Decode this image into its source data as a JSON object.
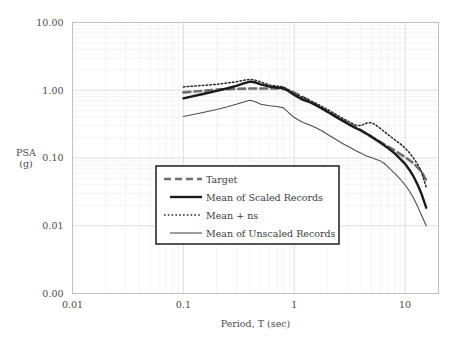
{
  "chart_data": {
    "type": "line",
    "title": "",
    "xlabel": "Period, T (sec)",
    "ylabel": "PSA\n(g)",
    "ylabel_line1": "PSA",
    "ylabel_line2": "(g)",
    "xscale": "log",
    "yscale": "log",
    "xlim": [
      0.01,
      20
    ],
    "ylim": [
      0.004,
      10
    ],
    "xticks": [
      "0.01",
      "0.1",
      "1",
      "10"
    ],
    "xtick_values": [
      0.01,
      0.1,
      1,
      10
    ],
    "yticks": [
      "10.00",
      "1.00",
      "0.10",
      "0.01",
      "0.00"
    ],
    "ytick_values": [
      10,
      1,
      0.1,
      0.01,
      0.004
    ],
    "grid": true,
    "grid_color": "#d9d9d9",
    "minor_grid_color": "#ececec",
    "border_color": "#bfbfbf",
    "legend_position": "center-left-inside",
    "series": [
      {
        "name": "Target",
        "style": "thick-dashed",
        "color": "#6f6f6f",
        "width": 2.6,
        "dash": "7,4",
        "x": [
          0.1,
          0.15,
          0.2,
          0.3,
          0.4,
          0.5,
          0.6,
          0.75,
          0.9,
          1.0,
          1.3,
          1.6,
          2.0,
          2.5,
          3.0,
          4.0,
          5.0,
          6.0,
          7.0,
          8.0,
          10.0,
          12.0,
          14.0,
          15.5
        ],
        "values": [
          0.93,
          0.98,
          1.02,
          1.05,
          1.06,
          1.06,
          1.06,
          1.06,
          1.0,
          0.92,
          0.74,
          0.6,
          0.49,
          0.395,
          0.335,
          0.255,
          0.205,
          0.172,
          0.148,
          0.13,
          0.103,
          0.083,
          0.063,
          0.047
        ]
      },
      {
        "name": "Mean of Scaled Records",
        "style": "thick-solid",
        "color": "#1a1a1a",
        "width": 2.4,
        "dash": "none",
        "x": [
          0.1,
          0.15,
          0.2,
          0.25,
          0.3,
          0.35,
          0.4,
          0.45,
          0.5,
          0.6,
          0.7,
          0.8,
          0.9,
          1.0,
          1.2,
          1.4,
          1.6,
          1.8,
          2.0,
          2.4,
          2.8,
          3.2,
          3.6,
          4.0,
          4.5,
          5.0,
          5.5,
          6.0,
          7.0,
          8.0,
          9.0,
          10.0,
          11.0,
          12.0,
          13.0,
          14.0,
          15.5
        ],
        "values": [
          0.76,
          0.88,
          0.98,
          1.07,
          1.16,
          1.26,
          1.34,
          1.3,
          1.22,
          1.13,
          1.1,
          1.08,
          0.96,
          0.85,
          0.72,
          0.66,
          0.59,
          0.53,
          0.48,
          0.4,
          0.345,
          0.305,
          0.275,
          0.255,
          0.228,
          0.205,
          0.185,
          0.168,
          0.14,
          0.118,
          0.098,
          0.082,
          0.066,
          0.052,
          0.04,
          0.03,
          0.0185
        ]
      },
      {
        "name": "Mean + ns",
        "style": "dotted",
        "color": "#2a2a2a",
        "width": 1.5,
        "dash": "1.6,2.2",
        "x": [
          0.1,
          0.15,
          0.2,
          0.25,
          0.3,
          0.35,
          0.4,
          0.45,
          0.5,
          0.6,
          0.7,
          0.8,
          0.9,
          1.0,
          1.2,
          1.4,
          1.6,
          1.8,
          2.0,
          2.4,
          2.8,
          3.2,
          3.6,
          4.0,
          4.3,
          4.6,
          5.0,
          5.4,
          6.0,
          7.0,
          8.0,
          9.0,
          10.0,
          11.0,
          12.0,
          13.0,
          14.0,
          15.5
        ],
        "values": [
          1.12,
          1.18,
          1.22,
          1.28,
          1.33,
          1.4,
          1.45,
          1.4,
          1.32,
          1.2,
          1.15,
          1.12,
          1.0,
          0.9,
          0.78,
          0.7,
          0.63,
          0.57,
          0.52,
          0.435,
          0.375,
          0.335,
          0.305,
          0.3,
          0.32,
          0.33,
          0.33,
          0.31,
          0.272,
          0.222,
          0.188,
          0.163,
          0.14,
          0.118,
          0.098,
          0.08,
          0.063,
          0.037
        ]
      },
      {
        "name": "Mean of Unscaled Records",
        "style": "thin-solid",
        "color": "#4d4d4d",
        "width": 1.1,
        "dash": "none",
        "x": [
          0.1,
          0.15,
          0.2,
          0.25,
          0.3,
          0.35,
          0.4,
          0.45,
          0.5,
          0.6,
          0.7,
          0.8,
          0.9,
          1.0,
          1.2,
          1.4,
          1.6,
          1.8,
          2.0,
          2.4,
          2.8,
          3.2,
          3.6,
          4.0,
          4.5,
          5.0,
          5.5,
          6.0,
          6.5,
          7.0,
          8.0,
          9.0,
          10.0,
          11.0,
          12.0,
          13.0,
          14.0,
          15.5
        ],
        "values": [
          0.41,
          0.47,
          0.52,
          0.57,
          0.62,
          0.67,
          0.71,
          0.67,
          0.62,
          0.59,
          0.575,
          0.55,
          0.46,
          0.395,
          0.335,
          0.305,
          0.275,
          0.248,
          0.222,
          0.186,
          0.16,
          0.143,
          0.128,
          0.118,
          0.107,
          0.101,
          0.095,
          0.09,
          0.083,
          0.074,
          0.06,
          0.049,
          0.04,
          0.032,
          0.025,
          0.019,
          0.0145,
          0.01
        ]
      }
    ]
  },
  "legend": {
    "entries": [
      {
        "label": "Target",
        "style": "thick-dashed"
      },
      {
        "label": "Mean of Scaled Records",
        "style": "thick-solid"
      },
      {
        "label": "Mean + ns",
        "style": "dotted"
      },
      {
        "label": "Mean of Unscaled Records",
        "style": "thin-solid"
      }
    ],
    "border_color": "#2b2b2b",
    "background": "#ffffff"
  },
  "axes": {
    "x_title": "Period, T (sec)",
    "y_title_line1": "PSA",
    "y_title_line2": "(g)",
    "x_tick_labels": [
      "0.01",
      "0.1",
      "1",
      "10"
    ],
    "y_tick_labels": [
      "10.00",
      "1.00",
      "0.10",
      "0.01",
      "0.00"
    ]
  }
}
